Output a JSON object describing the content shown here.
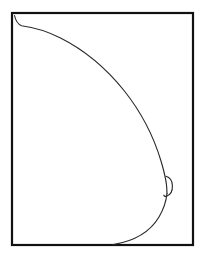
{
  "figure": {
    "title": "Breast lateral profile line drawing",
    "canvas": {
      "width": 205,
      "height": 258,
      "background_color": "#ffffff"
    },
    "frame": {
      "name": "rectangular border",
      "x": 12,
      "y": 13,
      "width": 181,
      "height": 232,
      "stroke_color": "#111111",
      "stroke_width": 2.2,
      "fill_color": "#ffffff"
    },
    "contour": {
      "name": "breast outline profile",
      "stroke_color": "#2b2b2b",
      "stroke_width": 1.15,
      "description": "Convex curve from upper chest wall sweeping out to the areola then back to the inframammary fold at the bottom border",
      "path": "M 14.5 15.5 C 15.6 20.6 17.6 24.0 21.5 25.8 C 34.0 27.4 47.0 31.3 60.5 38.0 C 84.0 49.8 105.5 67.5 124.0 90.5 C 141.0 111.8 153.5 136.0 161.0 161.0 C 163.6 169.6 165.4 177.2 166.4 184.0",
      "path_lower": "M 167.0 193.5 C 166.2 201.0 163.6 209.2 159.0 217.0 C 151.0 230.4 136.0 240.8 113.2 244.6"
    },
    "nipple": {
      "name": "areola protrusion",
      "stroke_color": "#2b2b2b",
      "stroke_width": 1.15,
      "center_x": 166,
      "center_y": 186,
      "radius_x": 6,
      "radius_y": 10,
      "path": "M 166.0 176.3 C 170.0 177.4 172.2 180.8 172.4 185.6 C 172.6 190.9 170.4 195.0 166.6 196.2 C 165.2 196.6 164.2 196.2 163.8 195.2"
    },
    "nipple_base": {
      "name": "areola base line",
      "path": "M 166.4 184.0 C 166.8 187.4 166.9 190.8 167.0 193.5"
    }
  }
}
